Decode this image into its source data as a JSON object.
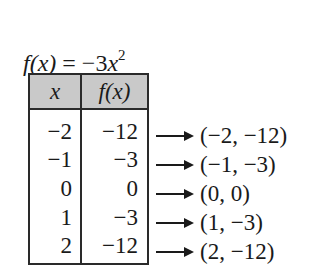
{
  "function": {
    "lhs": "f(x)",
    "equals": "=",
    "rhs_coef": "−3",
    "rhs_var": "x",
    "rhs_exp": "2"
  },
  "table": {
    "headers": [
      "x",
      "f(x)"
    ],
    "header_fill": "#c9c9c9",
    "rows": [
      {
        "x": "−2",
        "fx": "−12",
        "point": "(−2, −12)"
      },
      {
        "x": "−1",
        "fx": "−3",
        "point": "(−1, −3)"
      },
      {
        "x": "0",
        "fx": "0",
        "point": "(0, 0)"
      },
      {
        "x": "1",
        "fx": "−3",
        "point": "(1, −3)"
      },
      {
        "x": "2",
        "fx": "−12",
        "point": "(2, −12)"
      }
    ]
  }
}
